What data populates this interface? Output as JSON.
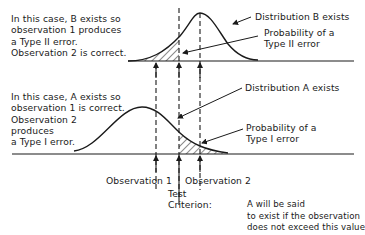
{
  "case_b": {
    "lines": [
      "In this case, B exists so",
      "observation 1 produces",
      "a Type II error.",
      "Observation 2 is correct."
    ]
  },
  "case_a": {
    "lines": [
      "In this case, A exists so",
      "observation 1 is correct.",
      "Observation 2",
      "produces",
      "a Type I error."
    ]
  },
  "labels": {
    "dist_b": "Distribution B exists",
    "prob_type2_line1": "Probability of a",
    "prob_type2_line2": "Type II error",
    "dist_a": "Distribution A exists",
    "prob_type1_line1": "Probability of a",
    "prob_type1_line2": "Type I error",
    "obs1": "Observation 1",
    "obs2": "Observation 2",
    "test_line1": "Test",
    "test_line2": "Criterion:",
    "criterion_line1": "A will be said",
    "criterion_line2": "to exist if the observation",
    "criterion_line3": "does not exceed this value"
  },
  "colors": {
    "ink": "#1a1a1a",
    "background": "#ffffff"
  }
}
